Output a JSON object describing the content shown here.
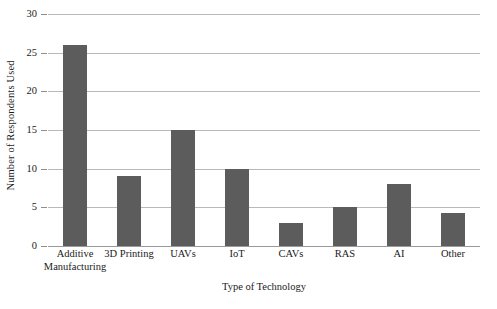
{
  "chart_data": {
    "type": "bar",
    "title": "",
    "xlabel": "Type of Technology",
    "ylabel": "Number of Respondents Used",
    "categories": [
      "Additive Manufacturing",
      "3D Printing",
      "UAVs",
      "IoT",
      "CAVs",
      "RAS",
      "AI",
      "Other"
    ],
    "category_lines": [
      [
        "Additive",
        "Manufacturing"
      ],
      [
        "3D Printing",
        ""
      ],
      [
        "UAVs",
        ""
      ],
      [
        "IoT",
        ""
      ],
      [
        "CAVs",
        ""
      ],
      [
        "RAS",
        ""
      ],
      [
        "AI",
        ""
      ],
      [
        "Other",
        ""
      ]
    ],
    "values": [
      26,
      9,
      15,
      10,
      3,
      5,
      8,
      4.3
    ],
    "ylim": [
      0,
      30
    ],
    "yticks": [
      0,
      5,
      10,
      15,
      20,
      25,
      30
    ],
    "ytick_labels": [
      "0",
      "5",
      "10",
      "15",
      "20",
      "25",
      "30"
    ],
    "grid": "horizontal",
    "legend": "none",
    "bar_color": "#5c5c5c",
    "gridline_color": "#b9b9b9",
    "background_color": "#ffffff"
  }
}
